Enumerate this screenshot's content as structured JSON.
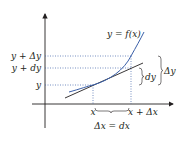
{
  "diagram": {
    "curve_label": "y = f(x)",
    "y_labels": {
      "y_plus_delta_y": "y + Δy",
      "y_plus_dy": "y + dy",
      "y": "y"
    },
    "x_labels": {
      "x": "x",
      "x_plus_delta_x": "x + Δx",
      "delta_x_eq_dx": "Δx = dx"
    },
    "brace_labels": {
      "dy": "dy",
      "delta_y": "Δy"
    },
    "colors": {
      "curve": "#3a5fa8",
      "tangent": "#231f20",
      "guides": "#3a5fa8",
      "axes": "#231f20"
    }
  }
}
